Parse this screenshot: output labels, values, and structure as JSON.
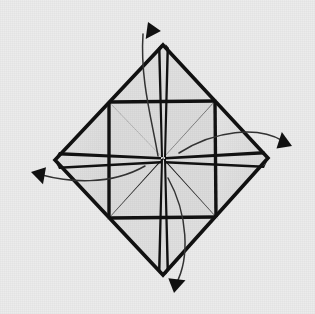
{
  "figure": {
    "kind": "paper-folding-diagram",
    "canvas": {
      "width": 315,
      "height": 314
    }
  },
  "colors": {
    "background": "#ececec",
    "paper_fill": "#dcdcdc",
    "paper_fill_light": "#e4e4e4",
    "crease_line": "#111111",
    "outline": "#111111",
    "arrow": "#111111",
    "arrow_curve": "#333333"
  },
  "geometry": {
    "center": {
      "x": 163,
      "y": 158
    },
    "diamond_vertices": {
      "top": {
        "x": 163,
        "y": 45
      },
      "right": {
        "x": 268,
        "y": 158
      },
      "bottom": {
        "x": 163,
        "y": 275
      },
      "left": {
        "x": 55,
        "y": 160
      }
    },
    "inner_square_midpoints": {
      "top_left": {
        "x": 109,
        "y": 102
      },
      "top_right": {
        "x": 215,
        "y": 101
      },
      "bottom_right": {
        "x": 216,
        "y": 217
      },
      "bottom_left": {
        "x": 109,
        "y": 218
      }
    },
    "crease_count": 8,
    "vertex_split_half_width_px": 5
  },
  "creases": [
    {
      "name": "crease-center-to-top",
      "angle_label": "up"
    },
    {
      "name": "crease-center-to-top-right",
      "angle_label": "up-right"
    },
    {
      "name": "crease-center-to-right",
      "angle_label": "right"
    },
    {
      "name": "crease-center-to-bottom-right",
      "angle_label": "down-right"
    },
    {
      "name": "crease-center-to-bottom",
      "angle_label": "down"
    },
    {
      "name": "crease-center-to-bottom-left",
      "angle_label": "down-left"
    },
    {
      "name": "crease-center-to-left",
      "angle_label": "left"
    },
    {
      "name": "crease-center-to-top-left",
      "angle_label": "up-left"
    }
  ],
  "arrows": [
    {
      "name": "fold-arrow-top",
      "direction": "up-left",
      "path": "M 158 156 C 152 120, 140 80, 143 34",
      "tip": {
        "x": 148,
        "y": 22
      },
      "tip_rotation_deg": -18
    },
    {
      "name": "fold-arrow-right",
      "direction": "down-right",
      "path": "M 179 153 C 215 130, 258 126, 283 141",
      "tip": {
        "x": 292,
        "y": 146
      },
      "tip_rotation_deg": 118
    },
    {
      "name": "fold-arrow-bottom",
      "direction": "down-left",
      "path": "M 168 178 C 188 214, 190 258, 176 284",
      "tip": {
        "x": 174,
        "y": 293
      },
      "tip_rotation_deg": 196
    },
    {
      "name": "fold-arrow-left",
      "direction": "down-left",
      "path": "M 145 166 C 110 186, 68 182, 42 175",
      "tip": {
        "x": 31,
        "y": 172
      },
      "tip_rotation_deg": 290
    }
  ],
  "panels": [
    {
      "name": "panel-north-west",
      "shade": "mid"
    },
    {
      "name": "panel-north-east",
      "shade": "mid"
    },
    {
      "name": "panel-east-north",
      "shade": "light"
    },
    {
      "name": "panel-east-south",
      "shade": "light"
    },
    {
      "name": "panel-south-east",
      "shade": "mid"
    },
    {
      "name": "panel-south-west",
      "shade": "mid"
    },
    {
      "name": "panel-west-south",
      "shade": "light"
    },
    {
      "name": "panel-west-north",
      "shade": "light"
    }
  ]
}
